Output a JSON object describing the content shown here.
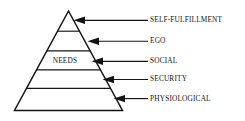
{
  "diagram": {
    "inner_label": "NEEDS",
    "colors": {
      "background": "#ffffff",
      "stroke": "#141414",
      "text": "#111111",
      "fill": "#ffffff"
    },
    "tiers": [
      {
        "label": "SELF-FULFILLMENT",
        "level": 5,
        "position": "apex"
      },
      {
        "label": "EGO",
        "level": 4,
        "position": "upper-middle"
      },
      {
        "label": "SOCIAL",
        "level": 3,
        "position": "middle"
      },
      {
        "label": "SECURITY",
        "level": 2,
        "position": "lower-middle"
      },
      {
        "label": "PHYSIOLOGICAL",
        "level": 1,
        "position": "base"
      }
    ]
  }
}
